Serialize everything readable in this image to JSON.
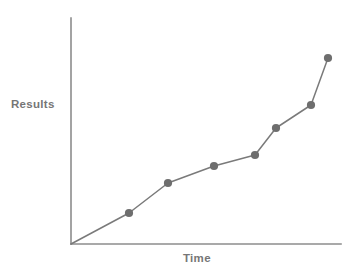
{
  "chart_data": {
    "type": "line",
    "title": "",
    "subtitle": "",
    "xlabel": "Time",
    "ylabel": "Results",
    "grid": false,
    "legend": null,
    "legend_position": "none",
    "xlim": [
      0,
      10
    ],
    "ylim": [
      0,
      10
    ],
    "x_tick_labels": [],
    "y_tick_labels": [],
    "annotations": [],
    "series": [
      {
        "name": "Results over time",
        "line_color": "#7a7a7a",
        "marker_color": "#6e6e6e",
        "marker_shape": "circle",
        "x": [
          0,
          2.15,
          3.59,
          5.29,
          6.81,
          7.59,
          8.89,
          9.52
        ],
        "values": [
          0,
          1.37,
          2.7,
          3.45,
          3.94,
          5.11,
          6.15,
          8.24
        ],
        "points_px": [
          {
            "x": 71,
            "y": 244
          },
          {
            "x": 129,
            "y": 213
          },
          {
            "x": 168,
            "y": 183
          },
          {
            "x": 214,
            "y": 166
          },
          {
            "x": 255,
            "y": 155
          },
          {
            "x": 276,
            "y": 128
          },
          {
            "x": 311,
            "y": 105
          },
          {
            "x": 328,
            "y": 58
          }
        ]
      }
    ],
    "axes_px": {
      "origin": {
        "x": 71,
        "y": 244
      },
      "y_axis_top": {
        "x": 71,
        "y": 18
      },
      "x_axis_right": {
        "x": 341,
        "y": 244
      },
      "axis_color": "#8c8c8c"
    }
  },
  "colors": {
    "background": "#ffffff",
    "axis": "#8c8c8c",
    "line": "#7a7a7a",
    "marker": "#6e6e6e",
    "label_text": "#767676"
  }
}
